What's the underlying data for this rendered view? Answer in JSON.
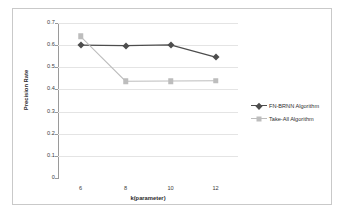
{
  "chart_data": {
    "type": "line",
    "title": "",
    "xlabel": "k(parameter)",
    "ylabel": "Precision Rate",
    "x": [
      6,
      8,
      10,
      12
    ],
    "xtick_labels": [
      "6",
      "8",
      "10",
      "12"
    ],
    "ytick_labels": [
      "0",
      "0.1",
      "0.2",
      "0.3",
      "0.4",
      "0.5",
      "0.6",
      "0.7"
    ],
    "yticks": [
      0,
      0.1,
      0.2,
      0.3,
      0.4,
      0.5,
      0.6,
      0.7
    ],
    "ylim": [
      0,
      0.7
    ],
    "xlim": [
      5,
      13
    ],
    "grid": "horizontal",
    "legend_position": "right",
    "series": [
      {
        "name": "FN-BRNN Algorithm",
        "values": [
          0.6,
          0.598,
          0.601,
          0.546
        ],
        "color": "#4d4d4d",
        "marker": "diamond"
      },
      {
        "name": "Take-All Algorithm",
        "values": [
          0.64,
          0.437,
          0.438,
          0.439
        ],
        "color": "#bdbdbd",
        "marker": "square"
      }
    ]
  },
  "figure": {
    "border_color": "#c9c9c9",
    "background": "#ffffff",
    "gridline_color": "#e4e4e4",
    "axis_color": "#9a9a9a"
  }
}
